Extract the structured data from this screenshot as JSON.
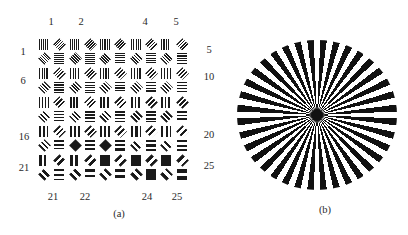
{
  "figure_a": {
    "caption": "(a)",
    "top_labels": [
      "1",
      "2",
      "4",
      "5"
    ],
    "left_labels": [
      "1",
      "6",
      "16",
      "21"
    ],
    "right_labels": [
      "5",
      "10",
      "20",
      "25"
    ],
    "bottom_labels": [
      "21",
      "22",
      "24",
      "25"
    ],
    "grid": {
      "columns": 5,
      "rows": 5,
      "bar_color": "#1a1a1a",
      "background_color": "#ffffff",
      "quadrants": {
        "tl": "vertical-bars",
        "tr": "diagonal-bars-45",
        "bl": "diagonal-bars-135",
        "br": "horizontal-bars"
      },
      "elements": [
        {
          "n": 1,
          "period": 2.0,
          "solid": []
        },
        {
          "n": 2,
          "period": 2.1,
          "solid": []
        },
        {
          "n": 3,
          "period": 2.2,
          "solid": []
        },
        {
          "n": 4,
          "period": 2.3,
          "solid": []
        },
        {
          "n": 5,
          "period": 2.4,
          "solid": []
        },
        {
          "n": 6,
          "period": 2.5,
          "solid": []
        },
        {
          "n": 7,
          "period": 2.6,
          "solid": []
        },
        {
          "n": 8,
          "period": 2.7,
          "solid": []
        },
        {
          "n": 9,
          "period": 2.8,
          "solid": []
        },
        {
          "n": 10,
          "period": 2.9,
          "solid": []
        },
        {
          "n": 11,
          "period": 3.0,
          "solid": []
        },
        {
          "n": 12,
          "period": 3.2,
          "solid": []
        },
        {
          "n": 13,
          "period": 3.4,
          "solid": []
        },
        {
          "n": 14,
          "period": 3.5,
          "solid": []
        },
        {
          "n": 15,
          "period": 3.6,
          "solid": []
        },
        {
          "n": 16,
          "period": 3.8,
          "solid": []
        },
        {
          "n": 17,
          "period": 4.0,
          "solid": [
            "bl"
          ]
        },
        {
          "n": 18,
          "period": 4.2,
          "solid": [
            "bl"
          ]
        },
        {
          "n": 19,
          "period": 4.4,
          "solid": []
        },
        {
          "n": 20,
          "period": 4.6,
          "solid": []
        },
        {
          "n": 21,
          "period": 5.0,
          "solid": []
        },
        {
          "n": 22,
          "period": 5.5,
          "solid": []
        },
        {
          "n": 23,
          "period": 6.0,
          "solid": [
            "tl"
          ]
        },
        {
          "n": 24,
          "period": 6.5,
          "solid": [
            "tl",
            "br"
          ]
        },
        {
          "n": 25,
          "period": 7.0,
          "solid": [
            "tl"
          ]
        }
      ]
    }
  },
  "figure_b": {
    "caption": "(b)",
    "spoke_count": 36,
    "spoke_color": "#111111",
    "gap_color": "#ffffff"
  }
}
